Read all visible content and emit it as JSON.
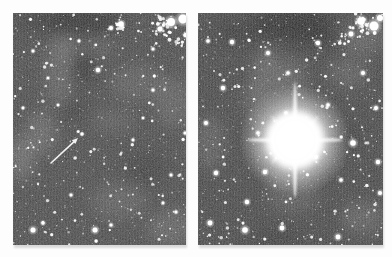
{
  "figure": {
    "colors": {
      "page_bg": "#fdfdfd",
      "star": "#ffffff",
      "nebula_light": "#b2b2b2",
      "nebula_dark": "#1c1c1c",
      "arrow": "#f2f2f2"
    },
    "panels": [
      {
        "id": "left",
        "name": "pre-supernova-field",
        "caption": "Star field before outburst; arrow marks the progenitor star",
        "x": 13,
        "y": 13,
        "width": 173,
        "height": 232,
        "base_color": "#4c4c4c",
        "grain_opacity": 0.42,
        "stars": {
          "seed": 11,
          "faint_count": 820,
          "medium_count": 85
        },
        "nebula_dark": [
          [
            72,
            10,
            35,
            14,
            0.45
          ],
          [
            30,
            8,
            25,
            11,
            0.3
          ],
          [
            70,
            55,
            11,
            16,
            0.4
          ],
          [
            132,
            155,
            20,
            15,
            0.22
          ],
          [
            58,
            96,
            13,
            11,
            0.25
          ]
        ],
        "nebula_light": [
          [
            46,
            60,
            14,
            38,
            0.22
          ],
          [
            55,
            33,
            9,
            15,
            0.2
          ],
          [
            125,
            70,
            28,
            18,
            0.18
          ],
          [
            160,
            90,
            18,
            25,
            0.2
          ],
          [
            28,
            120,
            16,
            22,
            0.25
          ],
          [
            8,
            145,
            14,
            22,
            0.3
          ],
          [
            100,
            108,
            22,
            12,
            0.15
          ],
          [
            105,
            188,
            28,
            18,
            0.18
          ],
          [
            158,
            215,
            24,
            18,
            0.22
          ],
          [
            85,
            32,
            18,
            12,
            0.15
          ]
        ],
        "clusters": [
          {
            "cx": 151,
            "cy": 13,
            "spread": 14,
            "count": 30,
            "seed": 3
          },
          {
            "cx": 104,
            "cy": 13,
            "spread": 9,
            "count": 14,
            "seed": 4
          },
          {
            "cx": 168,
            "cy": 28,
            "spread": 8,
            "count": 10,
            "seed": 5
          }
        ],
        "cluster_blobs": [
          [
            158,
            9,
            4.0
          ],
          [
            170,
            6,
            4.5
          ],
          [
            147,
            16,
            2.5
          ],
          [
            108,
            11,
            2.8
          ],
          [
            98,
            15,
            2.0
          ],
          [
            173,
            22,
            2.2
          ]
        ],
        "bright_stars": [
          [
            85,
            57,
            2.2
          ],
          [
            82,
            217,
            2.5
          ],
          [
            20,
            217,
            2.5
          ],
          [
            20,
            38,
            1.5
          ],
          [
            140,
            77,
            1.5
          ],
          [
            58,
            182,
            1.5
          ],
          [
            30,
            210,
            1.7
          ],
          [
            120,
            127,
            1.4
          ],
          [
            158,
            162,
            1.5
          ],
          [
            45,
            92,
            1.3
          ],
          [
            140,
            36,
            1.5
          ],
          [
            66,
            28,
            1.4
          ],
          [
            10,
            95,
            1.4
          ],
          [
            98,
            212,
            1.6
          ],
          [
            130,
            105,
            1.3
          ],
          [
            172,
            120,
            1.5
          ],
          [
            35,
            65,
            1.3
          ],
          [
            150,
            190,
            1.4
          ],
          [
            163,
            199,
            1.5
          ]
        ],
        "arrow": {
          "tail": [
            38,
            150
          ],
          "tip": [
            65,
            125
          ],
          "width": 1.6
        },
        "progenitor_star": [
          [
            69,
            121,
            1.7
          ],
          [
            65.2,
            118.6,
            1.3
          ]
        ]
      },
      {
        "id": "right",
        "name": "supernova-outburst",
        "caption": "Same field during the supernova outburst",
        "x": 198,
        "y": 13,
        "width": 185,
        "height": 232,
        "base_color": "#484848",
        "grain_opacity": 0.42,
        "stars": {
          "seed": 23,
          "faint_count": 900,
          "medium_count": 110
        },
        "nebula_dark": [
          [
            95,
            12,
            40,
            16,
            0.5
          ],
          [
            120,
            25,
            20,
            10,
            0.3
          ],
          [
            40,
            20,
            22,
            12,
            0.28
          ],
          [
            145,
            125,
            16,
            14,
            0.22
          ],
          [
            80,
            226,
            30,
            10,
            0.18
          ]
        ],
        "nebula_light": [
          [
            70,
            65,
            16,
            30,
            0.28
          ],
          [
            95,
            70,
            12,
            25,
            0.25
          ],
          [
            55,
            90,
            10,
            20,
            0.2
          ],
          [
            150,
            60,
            20,
            15,
            0.2
          ],
          [
            165,
            25,
            22,
            18,
            0.22
          ],
          [
            12,
            130,
            14,
            28,
            0.2
          ],
          [
            95,
            180,
            26,
            20,
            0.18
          ],
          [
            165,
            205,
            22,
            16,
            0.22
          ]
        ],
        "clusters": [
          {
            "cx": 165,
            "cy": 11,
            "spread": 14,
            "count": 30,
            "seed": 6
          },
          {
            "cx": 145,
            "cy": 25,
            "spread": 9,
            "count": 12,
            "seed": 7
          }
        ],
        "cluster_blobs": [
          [
            163,
            8,
            3.8
          ],
          [
            176,
            13,
            4.5
          ],
          [
            153,
            21,
            2.4
          ],
          [
            182,
            5,
            3.0
          ]
        ],
        "bright_stars": [
          [
            34,
            29,
            2.2
          ],
          [
            155,
            130,
            2.8
          ],
          [
            67,
            159,
            2.2
          ],
          [
            18,
            160,
            2.2
          ],
          [
            49,
            189,
            2.2
          ],
          [
            12,
            210,
            2.4
          ],
          [
            47,
            217,
            2.8
          ],
          [
            84,
            215,
            2.4
          ],
          [
            140,
            224,
            2.4
          ],
          [
            180,
            149,
            2.2
          ],
          [
            143,
            167,
            1.8
          ],
          [
            118,
            144,
            2.0
          ],
          [
            25,
            75,
            2.2
          ],
          [
            70,
            40,
            2.0
          ],
          [
            120,
            30,
            2.2
          ],
          [
            165,
            60,
            2.0
          ],
          [
            178,
            95,
            2.0
          ],
          [
            8,
            110,
            2.0
          ],
          [
            130,
            92,
            1.8
          ],
          [
            60,
            120,
            1.8
          ],
          [
            90,
            60,
            1.8
          ],
          [
            10,
            28,
            1.8
          ],
          [
            182,
            180,
            2.0
          ],
          [
            88,
            100,
            1.8
          ]
        ],
        "supernova": {
          "cx": 97,
          "cy": 127,
          "core_r": 19,
          "glow_r": 56,
          "spike_v": 58,
          "spike_h": 48,
          "spike_d": 34
        }
      }
    ]
  }
}
